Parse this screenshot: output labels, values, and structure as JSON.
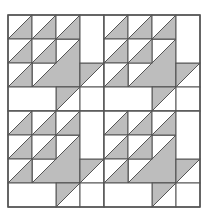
{
  "diagram": {
    "title": "",
    "type": "quilt-block-pattern",
    "colors": {
      "background": "#ffffff",
      "fabric_light": "#ffffff",
      "fabric_dark": "#bdbdbd",
      "seam_line": "#555555"
    },
    "origin": {
      "x": 8,
      "y": 15
    },
    "cell_size": 24,
    "block_cells": 4,
    "blocks_grid": {
      "rows": 2,
      "cols": 2
    },
    "block": {
      "squares": [
        {
          "r": 3,
          "c": 0,
          "w": 2,
          "h": 1
        },
        {
          "r": 0,
          "c": 3,
          "w": 1,
          "h": 2
        },
        {
          "r": 3,
          "c": 3,
          "w": 1,
          "h": 1
        }
      ],
      "hst_lower_right": [
        {
          "r": 0,
          "c": 0,
          "size": 1
        },
        {
          "r": 0,
          "c": 1,
          "size": 1
        },
        {
          "r": 0,
          "c": 2,
          "size": 1
        },
        {
          "r": 1,
          "c": 0,
          "size": 1
        },
        {
          "r": 1,
          "c": 1,
          "size": 1
        },
        {
          "r": 2,
          "c": 0,
          "size": 1
        },
        {
          "r": 1,
          "c": 1,
          "size": 2,
          "note": "large triangle, drawn under small cell"
        }
      ],
      "hst_upper_left": [
        {
          "r": 2,
          "c": 3,
          "size": 1
        },
        {
          "r": 3,
          "c": 2,
          "size": 1
        }
      ]
    }
  }
}
